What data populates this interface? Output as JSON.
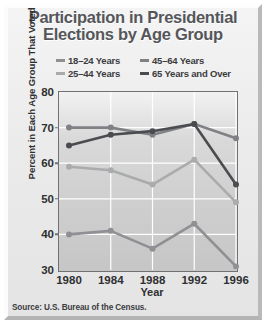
{
  "figure": {
    "title_line1": "Participation in Presidential",
    "title_line2": "Elections by Age Group",
    "source": "Source: U.S. Bureau of the Census.",
    "title_color": "#55565a",
    "plot_background": "#d2d2d2",
    "gridline_color": "#ffffff",
    "frame_color": "#6f7174"
  },
  "chart_data": {
    "type": "line",
    "title": "Participation in Presidential Elections by Age Group",
    "xlabel": "Year",
    "ylabel": "Percent in Each Age Group That Voted",
    "x": [
      1980,
      1984,
      1988,
      1992,
      1996
    ],
    "xticklabels": [
      "1980",
      "1984",
      "1988",
      "1992",
      "1996"
    ],
    "yticks": [
      30,
      40,
      50,
      60,
      70,
      80
    ],
    "yticklabels": [
      "30",
      "40",
      "50",
      "60",
      "70",
      "80"
    ],
    "ylim": [
      30,
      80
    ],
    "xlim": [
      1979,
      1997
    ],
    "grid": true,
    "legend_position": "above-plot",
    "markers": "circle",
    "series": [
      {
        "name": "18–24 Years",
        "color": "#8e9093",
        "values": [
          40,
          41,
          36,
          43,
          31
        ]
      },
      {
        "name": "25–44 Years",
        "color": "#a9abad",
        "values": [
          59,
          58,
          54,
          61,
          49
        ]
      },
      {
        "name": "45–64 Years",
        "color": "#7f8184",
        "values": [
          70,
          70,
          68,
          71,
          67
        ]
      },
      {
        "name": "65 Years and Over",
        "color": "#4a4c4f",
        "values": [
          65,
          68,
          69,
          71,
          54
        ]
      }
    ]
  }
}
